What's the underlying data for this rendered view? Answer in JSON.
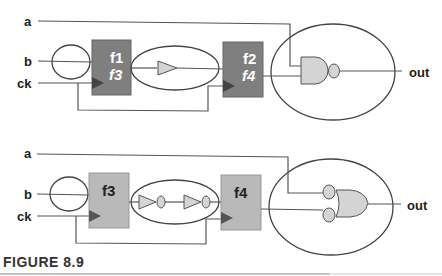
{
  "figure": {
    "caption": "FIGURE 8.9",
    "colors": {
      "dark_block": "#7f7f7f",
      "light_block": "#b9b9b9",
      "gate_fill": "#d4d4d4",
      "wire": "#555555"
    }
  },
  "top_circuit": {
    "inputs": {
      "a": "a",
      "b": "b",
      "ck": "ck"
    },
    "output": "out",
    "block1": {
      "line1": "f1",
      "line2": "f3"
    },
    "block2": {
      "line1": "f2",
      "line2": "f4"
    },
    "middle_logic": "buffer",
    "output_logic": "nand"
  },
  "bottom_circuit": {
    "inputs": {
      "a": "a",
      "b": "b",
      "ck": "ck"
    },
    "output": "out",
    "block1": {
      "line1": "f3"
    },
    "block2": {
      "line1": "f4"
    },
    "middle_logic": "two-inverters",
    "output_logic": "or-with-inverted-inputs"
  }
}
